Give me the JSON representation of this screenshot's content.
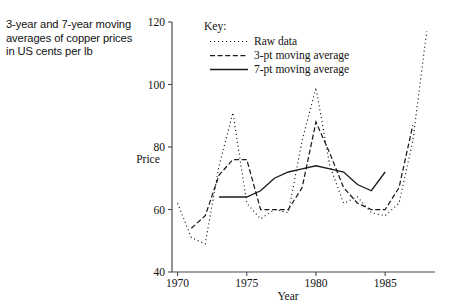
{
  "caption": {
    "text": "3-year and 7-year moving averages of copper prices in US cents per lb"
  },
  "axis": {
    "ylabel": "Price",
    "xlabel": "Year",
    "y_ticks": [
      "40",
      "60",
      "80",
      "100",
      "120"
    ],
    "x_ticks": [
      "1970",
      "1975",
      "1980",
      "1985"
    ]
  },
  "legend": {
    "title": "Key:",
    "items": [
      {
        "label": "Raw data",
        "style": "dotted"
      },
      {
        "label": "3-pt moving average",
        "style": "dashed"
      },
      {
        "label": "7-pt moving average",
        "style": "solid"
      }
    ]
  },
  "chart_data": {
    "type": "line",
    "title": "3-year and 7-year moving averages of copper prices in US cents per lb",
    "xlabel": "Year",
    "ylabel": "Price",
    "xlim": [
      1969.6,
      1988.6
    ],
    "ylim": [
      40,
      120
    ],
    "y_ticks": [
      40,
      60,
      80,
      100,
      120
    ],
    "x_ticks": [
      1970,
      1975,
      1980,
      1985
    ],
    "grid": false,
    "legend_position": "top-center",
    "series": [
      {
        "name": "Raw data",
        "style": "dotted",
        "x": [
          1970,
          1971,
          1972,
          1973,
          1974,
          1975,
          1976,
          1977,
          1978,
          1979,
          1980,
          1981,
          1982,
          1983,
          1984,
          1985,
          1986,
          1987,
          1988
        ],
        "values": [
          62,
          51,
          49,
          74,
          91,
          62,
          57,
          60,
          59,
          82,
          99,
          74,
          62,
          64,
          59,
          58,
          62,
          82,
          117
        ]
      },
      {
        "name": "3-pt moving average",
        "style": "dashed",
        "x": [
          1971,
          1972,
          1973,
          1974,
          1975,
          1976,
          1977,
          1978,
          1979,
          1980,
          1981,
          1982,
          1983,
          1984,
          1985,
          1986,
          1987
        ],
        "values": [
          54,
          58,
          71,
          76,
          76,
          60,
          60,
          60,
          67,
          88,
          78,
          67,
          62,
          60,
          60,
          67,
          87
        ]
      },
      {
        "name": "7-pt moving average",
        "style": "solid",
        "x": [
          1973,
          1974,
          1975,
          1976,
          1977,
          1978,
          1979,
          1980,
          1981,
          1982,
          1983,
          1984,
          1985
        ],
        "values": [
          64,
          64,
          64,
          66,
          70,
          72,
          73,
          74,
          73,
          72,
          68,
          66,
          72
        ]
      }
    ]
  }
}
